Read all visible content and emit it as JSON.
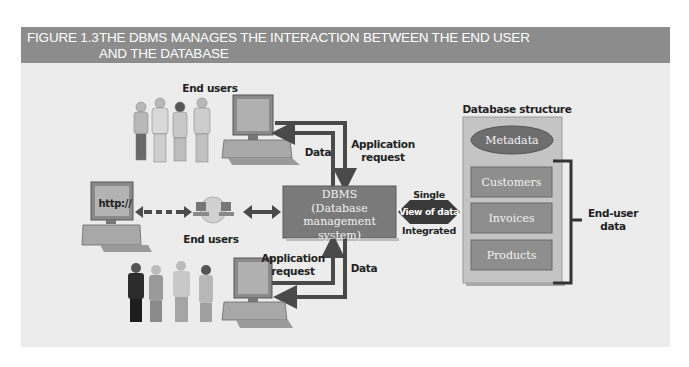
{
  "figure": {
    "number": "FIGURE 1.3",
    "title_line1": "THE DBMS MANAGES THE INTERACTION BETWEEN THE END USER",
    "title_line2": "AND THE DATABASE"
  },
  "labels": {
    "end_users_top": "End users",
    "end_users_middle": "End users",
    "data_top": "Data",
    "app_request_top_1": "Application",
    "app_request_top_2": "request",
    "app_request_bottom_1": "Application",
    "app_request_bottom_2": "request",
    "data_bottom": "Data",
    "http": "http://",
    "single": "Single",
    "view_of_data": "View of data",
    "integrated": "Integrated",
    "end_user_data_1": "End-user",
    "end_user_data_2": "data"
  },
  "dbms": {
    "line1": "DBMS",
    "line2": "(Database",
    "line3": "management system)"
  },
  "database_structure": {
    "title": "Database structure",
    "metadata": "Metadata",
    "tables": [
      "Customers",
      "Invoices",
      "Products"
    ]
  },
  "colors": {
    "header_bg": "#8c8c8c",
    "panel_bg": "#ececec",
    "dbms_box": "#7a7a7a",
    "arrow": "#4a4a4a",
    "bracket": "#333333"
  }
}
